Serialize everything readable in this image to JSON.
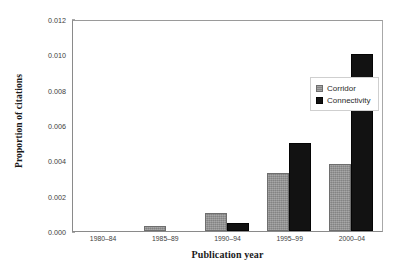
{
  "chart_data": {
    "type": "bar",
    "title": "",
    "xlabel": "Publication year",
    "ylabel": "Proportion of citations",
    "categories": [
      "1980–84",
      "1985–89",
      "1990–94",
      "1995–99",
      "2000–04"
    ],
    "series": [
      {
        "name": "Corridor",
        "color": "#8f8f8f",
        "values": [
          0.0,
          0.0003,
          0.001,
          0.0033,
          0.0038
        ]
      },
      {
        "name": "Connectivity",
        "color": "#121212",
        "values": [
          0.0,
          0.0,
          0.00045,
          0.005,
          0.01
        ]
      }
    ],
    "ylim": [
      0,
      0.012
    ],
    "yticks": [
      "0.000",
      "0.002",
      "0.004",
      "0.006",
      "0.008",
      "0.010",
      "0.012"
    ],
    "ytick_values": [
      0.0,
      0.002,
      0.004,
      0.006,
      0.008,
      0.01,
      0.012
    ],
    "grid": false,
    "legend_position": "inside-upper-right"
  }
}
